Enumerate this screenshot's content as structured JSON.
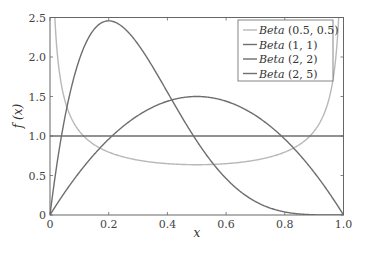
{
  "chart_data": {
    "type": "line",
    "title": "",
    "xlabel": "x",
    "ylabel": "f (x)",
    "xlim": [
      0,
      1
    ],
    "ylim": [
      0,
      2.5
    ],
    "xticks": [
      "0",
      "0.2",
      "0.4",
      "0.6",
      "0.8",
      "1.0"
    ],
    "yticks": [
      "0",
      "0.5",
      "1.0",
      "1.5",
      "2.0",
      "2.5"
    ],
    "grid": false,
    "legend_position": "upper right",
    "series": [
      {
        "name": "Beta (0.5,  0.5)",
        "alpha": 0.5,
        "beta": 0.5,
        "color": "#b8b8b8"
      },
      {
        "name": "Beta (1,  1)",
        "alpha": 1,
        "beta": 1,
        "color": "#6e6e6e"
      },
      {
        "name": "Beta (2,  2)",
        "alpha": 2,
        "beta": 2,
        "color": "#6e6e6e"
      },
      {
        "name": "Beta (2,  5)",
        "alpha": 2,
        "beta": 5,
        "color": "#6e6e6e"
      }
    ],
    "sample_points": {
      "x": [
        0.0,
        0.1,
        0.2,
        0.3,
        0.4,
        0.5,
        0.6,
        0.7,
        0.8,
        0.9,
        1.0
      ],
      "Beta (0.5,  0.5)": [
        null,
        1.06,
        0.8,
        0.69,
        0.65,
        0.64,
        0.65,
        0.69,
        0.8,
        1.06,
        null
      ],
      "Beta (1,  1)": [
        1,
        1,
        1,
        1,
        1,
        1,
        1,
        1,
        1,
        1,
        1
      ],
      "Beta (2,  2)": [
        0,
        0.54,
        0.96,
        1.26,
        1.44,
        1.5,
        1.44,
        1.26,
        0.96,
        0.54,
        0
      ],
      "Beta (2,  5)": [
        0,
        1.97,
        2.46,
        2.16,
        1.56,
        0.94,
        0.46,
        0.17,
        0.04,
        0.003,
        0
      ]
    }
  },
  "legend": {
    "items": [
      {
        "name": "Beta",
        "params": "(0.5,  0.5)",
        "color": "#b8b8b8"
      },
      {
        "name": "Beta",
        "params": "(1,  1)",
        "color": "#6e6e6e"
      },
      {
        "name": "Beta",
        "params": "(2,  2)",
        "color": "#6e6e6e"
      },
      {
        "name": "Beta",
        "params": "(2,  5)",
        "color": "#6e6e6e"
      }
    ]
  }
}
